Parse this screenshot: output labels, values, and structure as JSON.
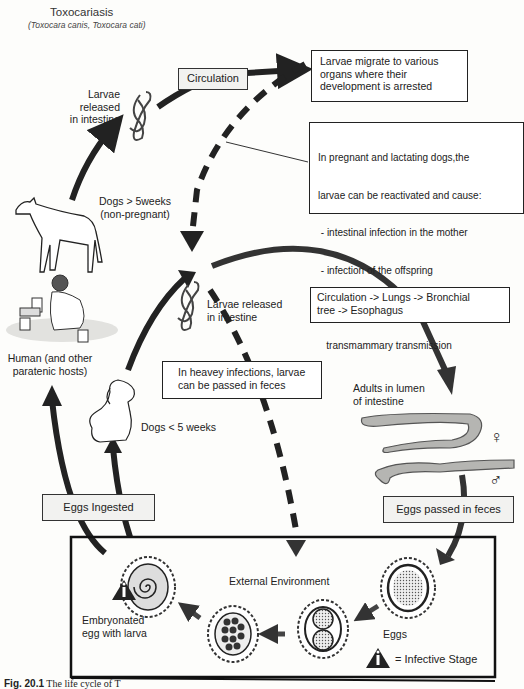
{
  "header": {
    "title": "Toxocariasis",
    "subtitle": "(Toxocara canis, Toxocara cati)"
  },
  "labels": {
    "larvae_released_top": "Larvae released in intestine",
    "larvae_released_top_lines": [
      "Larvae",
      "released",
      "in intestine"
    ],
    "circulation": "Circulation",
    "larvae_migrate": [
      "Larvae migrate to various",
      "organs where their",
      "development is arrested"
    ],
    "pregnant_note": [
      "In pregnant and lactating dogs,the",
      "larvae can be reactivated and cause:",
      " - intestinal infection in the mother",
      " - infection of the offspring",
      "   (by transplacental and",
      "   transmammary transmission"
    ],
    "dogs_over_5": [
      "Dogs > 5weeks",
      "(non-pregnant)"
    ],
    "larvae_released_mid": [
      "Larvae released",
      "in intestine"
    ],
    "circulation_lungs": [
      "Circulation -> Lungs -> Bronchial",
      "tree -> Esophagus"
    ],
    "human_hosts": [
      "Human (and other",
      "paratenic hosts)"
    ],
    "heavy_infections": [
      "In heavey infections, larvae",
      "can be passed in feces"
    ],
    "dogs_under_5": "Dogs < 5 weeks",
    "adults_lumen": [
      "Adults in lumen",
      "of intestine"
    ],
    "female_symbol": "♀",
    "male_symbol": "♂",
    "eggs_ingested": "Eggs Ingested",
    "eggs_passed": "Eggs passed in feces",
    "external_environment": "External Environment",
    "embryonated_egg": [
      "Embryonated",
      "egg with larva"
    ],
    "eggs": "Eggs",
    "infective_stage": "= Infective Stage",
    "infective_icon_glyph": "i"
  },
  "caption": {
    "fig_number": "Fig. 20.1",
    "text": "The life cycle of T"
  },
  "colors": {
    "arrow": "#222222",
    "worm_fill": "#b5b5b2",
    "gray_box": "#f2f2f0"
  }
}
